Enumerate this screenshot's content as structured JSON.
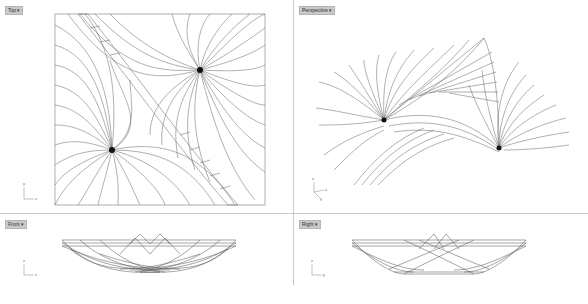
{
  "viewports": {
    "top": {
      "label": "Top",
      "axis": {
        "v": "y",
        "h": "x"
      }
    },
    "perspective": {
      "label": "Perspective",
      "axis": {
        "v": "z",
        "h": "x",
        "d": "y"
      }
    },
    "front": {
      "label": "Front",
      "axis": {
        "v": "z",
        "h": "x"
      }
    },
    "right": {
      "label": "Right",
      "axis": {
        "v": "z",
        "h": "y"
      }
    }
  },
  "dropdown_arrow": "▾",
  "colors": {
    "background": "#ffffff",
    "label_bg": "#c9c9c9",
    "divider": "#c9c9c9",
    "curves": "#222222"
  },
  "caption": ""
}
